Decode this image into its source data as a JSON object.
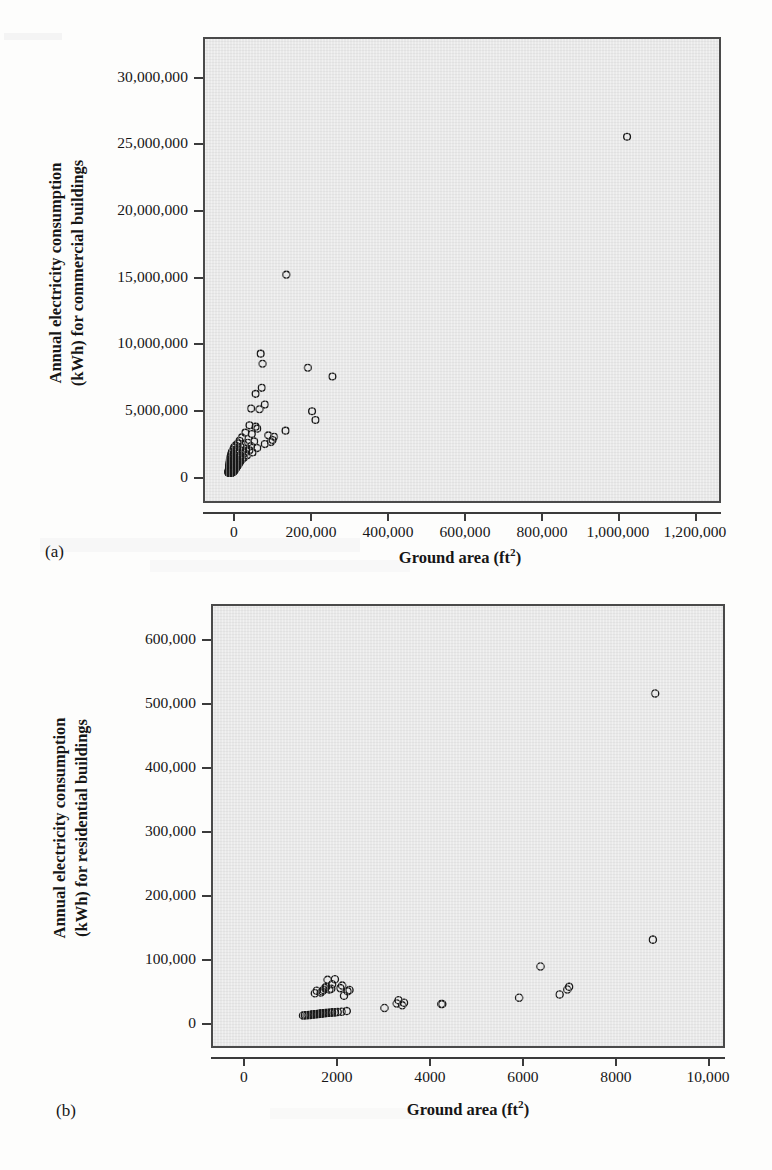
{
  "figure": {
    "background_color": "#fdfdfc",
    "plot_area_color": "#e9e9e9",
    "marker_color": "#1a1a1a"
  },
  "panels": [
    {
      "tag": "(a)",
      "x_axis_title_main": "Ground area (ft",
      "x_axis_title_sup": "2",
      "x_axis_title_tail": ")",
      "y_axis_title_line1": "Annual electricity consumption",
      "y_axis_title_line2": "(kWh) for commercial buildings",
      "x_ticks": [
        "0",
        "200,000",
        "400,000",
        "600,000",
        "800,000",
        "1,000,000",
        "1,200,000"
      ],
      "y_ticks": [
        "0",
        "5,000,000",
        "10,000,000",
        "15,000,000",
        "20,000,000",
        "25,000,000",
        "30,000,000"
      ]
    },
    {
      "tag": "(b)",
      "x_axis_title_main": "Ground area (ft",
      "x_axis_title_sup": "2",
      "x_axis_title_tail": ")",
      "y_axis_title_line1": "Annual electricity consumption",
      "y_axis_title_line2": "(kWh) for residential buildings",
      "x_ticks": [
        "0",
        "2000",
        "4000",
        "6000",
        "8000",
        "10,000"
      ],
      "y_ticks": [
        "0",
        "100,000",
        "200,000",
        "300,000",
        "400,000",
        "500,000",
        "600,000"
      ]
    }
  ],
  "chart_data": [
    {
      "type": "scatter",
      "panel": "(a)",
      "title": "",
      "xlabel": "Ground area (ft2)",
      "ylabel": "Annual electricity consumption (kWh) for commercial buildings",
      "xlim": [
        -60000,
        1290000
      ],
      "ylim": [
        -2400000,
        32400000
      ],
      "xticks": [
        0,
        200000,
        400000,
        600000,
        800000,
        1000000,
        1200000
      ],
      "yticks": [
        0,
        5000000,
        10000000,
        15000000,
        20000000,
        25000000,
        30000000
      ],
      "grid": false,
      "legend": null,
      "marker": "open-circle",
      "points": [
        [
          1040000,
          25100000
        ],
        [
          152000,
          14800000
        ],
        [
          85000,
          8900000
        ],
        [
          90000,
          8150000
        ],
        [
          208000,
          7850000
        ],
        [
          272000,
          7200000
        ],
        [
          88000,
          6350000
        ],
        [
          72000,
          5900000
        ],
        [
          96000,
          5100000
        ],
        [
          60000,
          4800000
        ],
        [
          82000,
          4750000
        ],
        [
          219000,
          4600000
        ],
        [
          228000,
          3950000
        ],
        [
          56000,
          3550000
        ],
        [
          72000,
          3450000
        ],
        [
          76000,
          3300000
        ],
        [
          150000,
          3150000
        ],
        [
          45000,
          3000000
        ],
        [
          62000,
          2900000
        ],
        [
          105000,
          2800000
        ],
        [
          120000,
          2700000
        ],
        [
          36000,
          2650000
        ],
        [
          116000,
          2450000
        ],
        [
          30000,
          2400000
        ],
        [
          68000,
          2350000
        ],
        [
          112000,
          2300000
        ],
        [
          52000,
          2250000
        ],
        [
          26000,
          2200000
        ],
        [
          96000,
          2150000
        ],
        [
          42000,
          2100000
        ],
        [
          20000,
          2050000
        ],
        [
          60000,
          2000000
        ],
        [
          33000,
          1950000
        ],
        [
          16000,
          1900000
        ],
        [
          76000,
          1850000
        ],
        [
          48000,
          1800000
        ],
        [
          24000,
          1760000
        ],
        [
          13000,
          1720000
        ],
        [
          56000,
          1680000
        ],
        [
          38000,
          1640000
        ],
        [
          19000,
          1600000
        ],
        [
          10000,
          1560000
        ],
        [
          64000,
          1520000
        ],
        [
          44000,
          1480000
        ],
        [
          28000,
          1440000
        ],
        [
          15000,
          1400000
        ],
        [
          8000,
          1360000
        ],
        [
          50000,
          1320000
        ],
        [
          34000,
          1280000
        ],
        [
          22000,
          1240000
        ],
        [
          12000,
          1200000
        ],
        [
          6000,
          1170000
        ],
        [
          42000,
          1140000
        ],
        [
          30000,
          1110000
        ],
        [
          18000,
          1080000
        ],
        [
          10000,
          1050000
        ],
        [
          5000,
          1020000
        ],
        [
          36000,
          990000
        ],
        [
          26000,
          960000
        ],
        [
          16000,
          930000
        ],
        [
          9000,
          900000
        ],
        [
          4500,
          875000
        ],
        [
          32000,
          850000
        ],
        [
          23000,
          825000
        ],
        [
          14000,
          800000
        ],
        [
          8000,
          775000
        ],
        [
          4000,
          750000
        ],
        [
          29000,
          725000
        ],
        [
          21000,
          700000
        ],
        [
          13000,
          680000
        ],
        [
          7500,
          660000
        ],
        [
          3600,
          640000
        ],
        [
          27000,
          620000
        ],
        [
          19000,
          600000
        ],
        [
          12000,
          580000
        ],
        [
          7000,
          560000
        ],
        [
          3300,
          545000
        ],
        [
          25000,
          530000
        ],
        [
          18000,
          515000
        ],
        [
          11000,
          500000
        ],
        [
          6500,
          485000
        ],
        [
          3000,
          470000
        ],
        [
          23000,
          455000
        ],
        [
          17000,
          440000
        ],
        [
          10500,
          425000
        ],
        [
          6000,
          412000
        ],
        [
          2800,
          400000
        ],
        [
          21000,
          388000
        ],
        [
          16000,
          375000
        ],
        [
          10000,
          362000
        ],
        [
          5600,
          350000
        ],
        [
          2600,
          340000
        ],
        [
          20000,
          328000
        ],
        [
          15000,
          316000
        ],
        [
          9500,
          305000
        ],
        [
          5200,
          294000
        ],
        [
          2400,
          284000
        ],
        [
          19000,
          274000
        ],
        [
          14000,
          264000
        ],
        [
          9000,
          254000
        ],
        [
          4900,
          245000
        ],
        [
          2200,
          236000
        ],
        [
          18000,
          227000
        ],
        [
          13500,
          218000
        ],
        [
          8500,
          210000
        ],
        [
          4600,
          202000
        ],
        [
          2100,
          194000
        ],
        [
          17000,
          186000
        ],
        [
          13000,
          178000
        ],
        [
          8000,
          171000
        ],
        [
          4300,
          164000
        ],
        [
          2000,
          157000
        ],
        [
          16000,
          150000
        ],
        [
          12500,
          144000
        ],
        [
          7600,
          138000
        ],
        [
          4000,
          132000
        ],
        [
          1900,
          126000
        ],
        [
          15000,
          120000
        ],
        [
          12000,
          114000
        ],
        [
          7200,
          109000
        ],
        [
          3800,
          104000
        ],
        [
          1800,
          99000
        ],
        [
          14000,
          94000
        ],
        [
          11500,
          89000
        ],
        [
          6800,
          84000
        ],
        [
          3600,
          80000
        ],
        [
          1700,
          76000
        ],
        [
          13000,
          72000
        ],
        [
          11000,
          68000
        ],
        [
          6400,
          64000
        ],
        [
          3400,
          60000
        ],
        [
          1600,
          56000
        ],
        [
          12000,
          52000
        ],
        [
          10500,
          48000
        ],
        [
          6000,
          44000
        ],
        [
          3200,
          40000
        ],
        [
          1500,
          36000
        ],
        [
          11000,
          33000
        ],
        [
          9800,
          30000
        ],
        [
          5600,
          27000
        ],
        [
          3000,
          24000
        ],
        [
          1400,
          21000
        ],
        [
          10000,
          18000
        ],
        [
          9000,
          15000
        ],
        [
          5200,
          12000
        ],
        [
          2800,
          9000
        ],
        [
          1300,
          6000
        ],
        [
          8000,
          4000
        ],
        [
          7000,
          2000
        ]
      ],
      "n_points": 148,
      "notes": "Dense cluster near origin; one extreme outlier near (1,040,000 ft2, 25,100,000 kWh)"
    },
    {
      "type": "scatter",
      "panel": "(b)",
      "title": "",
      "xlabel": "Ground area (ft2)",
      "ylabel": "Annual electricity consumption (kWh) for residential buildings",
      "xlim": [
        -500,
        10800
      ],
      "ylim": [
        -48000,
        648000
      ],
      "xticks": [
        0,
        2000,
        4000,
        6000,
        8000,
        10000
      ],
      "yticks": [
        0,
        100000,
        200000,
        300000,
        400000,
        500000,
        600000
      ],
      "grid": false,
      "legend": null,
      "marker": "open-circle",
      "points": [
        [
          9220,
          511000
        ],
        [
          9170,
          125000
        ],
        [
          6700,
          83000
        ],
        [
          7330,
          51000
        ],
        [
          7290,
          47000
        ],
        [
          7120,
          39000
        ],
        [
          6230,
          34000
        ],
        [
          4520,
          24000
        ],
        [
          4540,
          24000
        ],
        [
          3700,
          26000
        ],
        [
          3660,
          22000
        ],
        [
          3580,
          30000
        ],
        [
          3540,
          25000
        ],
        [
          3270,
          18000
        ],
        [
          2500,
          46000
        ],
        [
          2460,
          44000
        ],
        [
          2380,
          37000
        ],
        [
          2340,
          53000
        ],
        [
          2300,
          49000
        ],
        [
          2180,
          63000
        ],
        [
          2120,
          55000
        ],
        [
          2100,
          48000
        ],
        [
          2060,
          47000
        ],
        [
          2020,
          62000
        ],
        [
          1990,
          51000
        ],
        [
          1960,
          49000
        ],
        [
          1930,
          46000
        ],
        [
          1900,
          44000
        ],
        [
          1870,
          42000
        ],
        [
          1780,
          45000
        ],
        [
          1740,
          41000
        ],
        [
          2440,
          13000
        ],
        [
          2330,
          12000
        ],
        [
          2240,
          11500
        ],
        [
          2180,
          11000
        ],
        [
          2120,
          11000
        ],
        [
          2080,
          10500
        ],
        [
          2040,
          10500
        ],
        [
          2000,
          10000
        ],
        [
          1970,
          10000
        ],
        [
          1940,
          9500
        ],
        [
          1910,
          9500
        ],
        [
          1880,
          9000
        ],
        [
          1850,
          9000
        ],
        [
          1820,
          8500
        ],
        [
          1790,
          8500
        ],
        [
          1760,
          8000
        ],
        [
          1730,
          8000
        ],
        [
          1700,
          7500
        ],
        [
          1670,
          7500
        ],
        [
          1640,
          7000
        ],
        [
          1600,
          7000
        ],
        [
          1560,
          6500
        ],
        [
          1520,
          6500
        ],
        [
          1480,
          6000
        ]
      ],
      "n_points": 55,
      "notes": "Most points below 70,000 kWh between 1500-2500 ft2; outlier at (9,220 ft2, 511,000 kWh)"
    }
  ]
}
